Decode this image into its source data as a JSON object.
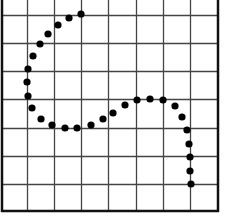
{
  "figure": {
    "title": "",
    "background": "#ffffff",
    "grid_color": "#444444",
    "border_color": "#111111",
    "dot_color": "#000000"
  },
  "grid": {
    "left": 2,
    "right": 218,
    "top": 0,
    "bottom": 211,
    "vertical_lines": [
      27,
      54,
      81,
      108,
      136,
      163,
      190
    ],
    "horizontal_lines": [
      15,
      43,
      71,
      99,
      128,
      156,
      184
    ],
    "columns": 8,
    "rows_visible": 8
  },
  "chart_data": {
    "type": "scatter",
    "title": "",
    "xlabel": "",
    "ylabel": "",
    "grid": true,
    "points_px": [
      [
        81,
        14
      ],
      [
        69,
        18
      ],
      [
        58,
        25
      ],
      [
        48,
        34
      ],
      [
        40,
        44
      ],
      [
        33,
        56
      ],
      [
        28,
        69
      ],
      [
        27,
        82
      ],
      [
        28,
        96
      ],
      [
        32,
        108
      ],
      [
        41,
        119
      ],
      [
        52,
        125
      ],
      [
        65,
        128
      ],
      [
        77,
        128
      ],
      [
        91,
        125
      ],
      [
        103,
        119
      ],
      [
        113,
        113
      ],
      [
        125,
        105
      ],
      [
        137,
        100
      ],
      [
        150,
        99
      ],
      [
        163,
        100
      ],
      [
        175,
        106
      ],
      [
        182,
        117
      ],
      [
        187,
        130
      ],
      [
        189,
        144
      ],
      [
        190,
        157
      ],
      [
        190,
        171
      ],
      [
        191,
        184
      ]
    ],
    "dot_radius": 3.6
  }
}
